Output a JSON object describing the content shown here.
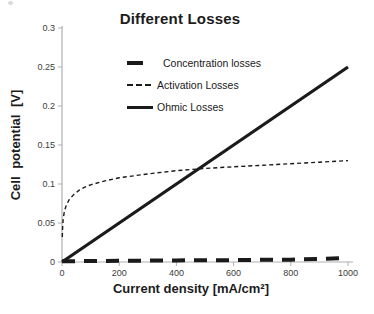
{
  "chart_data": {
    "type": "line",
    "title": "Different Losses",
    "xlabel": "Current density [mA/cm²]",
    "ylabel": "Cell potential [V]",
    "xlim": [
      0,
      1000
    ],
    "ylim": [
      0,
      0.3
    ],
    "grid": "off",
    "legend_position": "upper-left-inside",
    "colors": {
      "line": "#1a1a1a",
      "axis": "#b0b0b0",
      "tick_label": "#3c3c3c"
    },
    "x_ticks": {
      "values": [
        0,
        200,
        400,
        600,
        800,
        1000
      ],
      "labels": [
        "0",
        "200",
        "400",
        "600",
        "800",
        "1000"
      ]
    },
    "y_ticks": {
      "values": [
        0,
        0.05,
        0.1,
        0.15,
        0.2,
        0.25,
        0.3
      ],
      "labels": [
        "0",
        "0.05",
        "0.1",
        "0.15",
        "0.2",
        "0.25",
        "0.3"
      ]
    },
    "series": [
      {
        "name": "Concentration losses",
        "style": "thick-dash",
        "points": [
          [
            0,
            0.001
          ],
          [
            100,
            0.0012
          ],
          [
            200,
            0.0015
          ],
          [
            300,
            0.0018
          ],
          [
            400,
            0.002
          ],
          [
            500,
            0.0022
          ],
          [
            600,
            0.0025
          ],
          [
            700,
            0.0028
          ],
          [
            800,
            0.003
          ],
          [
            900,
            0.004
          ],
          [
            1000,
            0.005
          ]
        ]
      },
      {
        "name": "Activation Losses",
        "style": "fine-dash",
        "points": [
          [
            1,
            0.032
          ],
          [
            2,
            0.044
          ],
          [
            4,
            0.054
          ],
          [
            7,
            0.062
          ],
          [
            10,
            0.067
          ],
          [
            15,
            0.073
          ],
          [
            25,
            0.08
          ],
          [
            40,
            0.086
          ],
          [
            60,
            0.092
          ],
          [
            80,
            0.096
          ],
          [
            100,
            0.099
          ],
          [
            150,
            0.104
          ],
          [
            200,
            0.108
          ],
          [
            300,
            0.113
          ],
          [
            400,
            0.117
          ],
          [
            500,
            0.12
          ],
          [
            600,
            0.122
          ],
          [
            700,
            0.124
          ],
          [
            800,
            0.126
          ],
          [
            900,
            0.128
          ],
          [
            1000,
            0.13
          ]
        ]
      },
      {
        "name": "Ohmic Losses",
        "style": "solid",
        "points": [
          [
            0,
            0
          ],
          [
            1000,
            0.25
          ]
        ]
      }
    ]
  }
}
